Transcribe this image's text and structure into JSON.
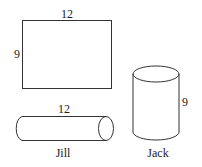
{
  "sheet": {
    "width_label": "12",
    "height_label": "9"
  },
  "jill_cylinder": {
    "length_label": "12",
    "name": "Jill"
  },
  "jack_cylinder": {
    "height_label": "9",
    "name": "Jack"
  }
}
